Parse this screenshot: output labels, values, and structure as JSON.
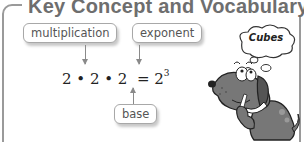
{
  "panel": {
    "title": "Key Concept and Vocabulary"
  },
  "labels": {
    "multiplication": "multiplication",
    "exponent": "exponent",
    "base": "base"
  },
  "equation": {
    "left": "2 • 2 • 2",
    "equals": "=",
    "base": "2",
    "exponent": "3"
  },
  "illustration": {
    "thought_bubble": "Cubes",
    "character": "dog"
  },
  "colors": {
    "frame": "#9a9a9a",
    "title": "#6e6e6e",
    "dog_body": "#777777"
  }
}
